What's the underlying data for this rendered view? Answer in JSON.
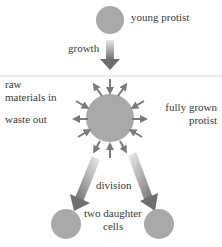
{
  "diagram": {
    "labels": {
      "young": "young protist",
      "growth": "growth",
      "raw": "raw",
      "materials_in": "materials in",
      "waste_out": "waste out",
      "fully_grown_1": "fully grown",
      "fully_grown_2": "protist",
      "division": "division",
      "daughter_1": "two daughter",
      "daughter_2": "cells"
    },
    "colors": {
      "cell": "#a9a9a9",
      "arrow": "#7a7a7a",
      "divider": "#e6e6e6"
    }
  }
}
